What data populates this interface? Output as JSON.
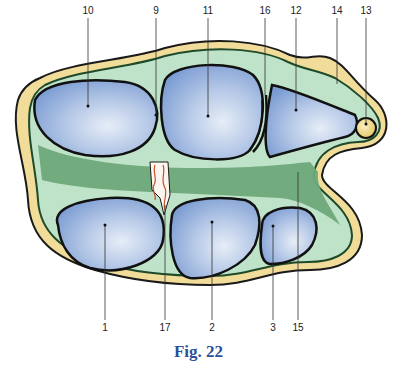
{
  "figure": {
    "caption": "Fig. 22",
    "colors": {
      "outer_layer": "#f1dc9a",
      "middle_layer": "#bfe3c8",
      "inner_dark_band": "#6ea97a",
      "compartment_fill": "#8aa9d8",
      "compartment_highlight": "#e3ebf6",
      "outline": "#1a1a1a",
      "caption": "#2c4f9a",
      "vessel_red": "#c8502a"
    },
    "labels": [
      {
        "id": "1",
        "text": "1",
        "position": "bottom"
      },
      {
        "id": "2",
        "text": "2",
        "position": "bottom"
      },
      {
        "id": "3",
        "text": "3",
        "position": "bottom"
      },
      {
        "id": "9",
        "text": "9",
        "position": "top"
      },
      {
        "id": "10",
        "text": "10",
        "position": "top"
      },
      {
        "id": "11",
        "text": "11",
        "position": "top"
      },
      {
        "id": "12",
        "text": "12",
        "position": "top"
      },
      {
        "id": "13",
        "text": "13",
        "position": "top"
      },
      {
        "id": "14",
        "text": "14",
        "position": "top"
      },
      {
        "id": "15",
        "text": "15",
        "position": "top"
      },
      {
        "id": "16",
        "text": "16",
        "position": "bottom"
      },
      {
        "id": "17",
        "text": "17",
        "position": "bottom"
      }
    ]
  }
}
